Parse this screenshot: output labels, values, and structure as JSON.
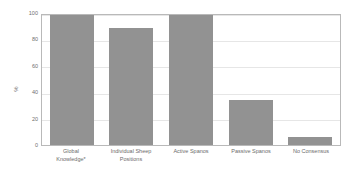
{
  "chart_data": {
    "type": "bar",
    "title": "",
    "xlabel": "",
    "ylabel": "%",
    "ylim": [
      0,
      100
    ],
    "yticks": [
      0,
      20,
      40,
      60,
      80,
      100
    ],
    "grid": true,
    "legend": false,
    "categories": [
      "Global Knowledge*",
      "Individual Sheep Positions",
      "Active Spanos",
      "Passive Spanos",
      "No Consensus"
    ],
    "category_lines": [
      [
        "Global",
        "Knowledge*"
      ],
      [
        "Individual Sheep",
        "Positions"
      ],
      [
        "Active Spanos",
        ""
      ],
      [
        "Passive Spanos",
        ""
      ],
      [
        "No Consensus",
        ""
      ]
    ],
    "values": [
      100,
      90,
      100,
      35,
      6
    ],
    "bar_color": "#929292"
  }
}
